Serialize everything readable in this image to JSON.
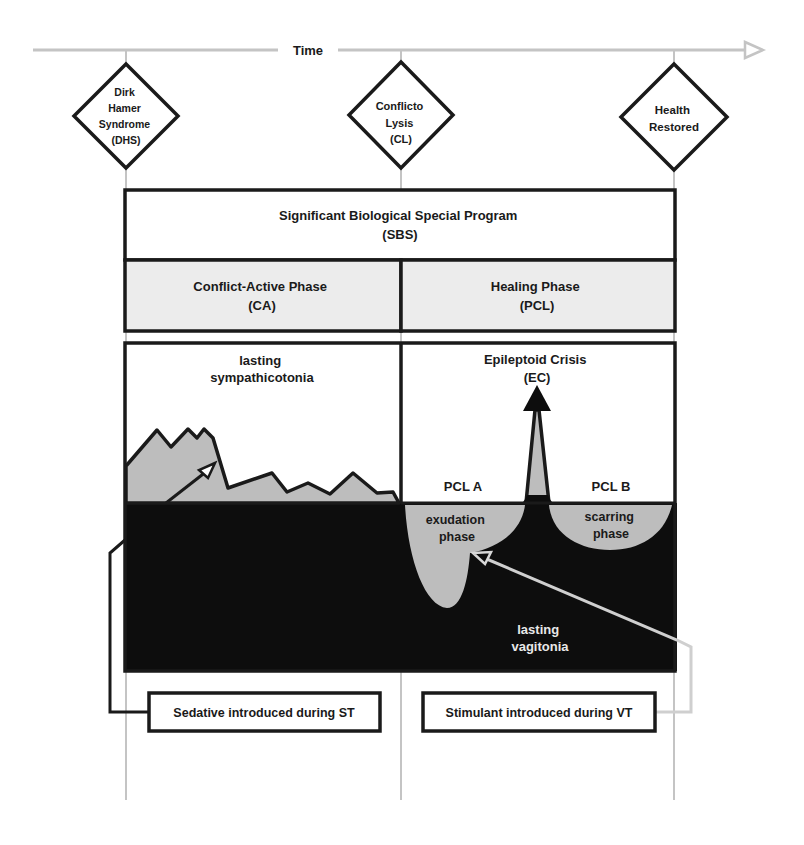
{
  "timeline": {
    "label": "Time",
    "milestones": [
      {
        "id": "dhs",
        "lines": [
          "Dirk",
          "Hamer",
          "Syndrome",
          "(DHS)"
        ]
      },
      {
        "id": "cl",
        "lines": [
          "Conflicto",
          "Lysis",
          "(CL)"
        ]
      },
      {
        "id": "health",
        "lines": [
          "Health",
          "Restored"
        ]
      }
    ]
  },
  "sbs": {
    "title": "Significant Biological Special Program",
    "abbr": "(SBS)"
  },
  "phases": {
    "active": {
      "title": "Conflict-Active Phase",
      "abbr": "(CA)"
    },
    "healing": {
      "title": "Healing Phase",
      "abbr": "(PCL)"
    }
  },
  "graph": {
    "sympathicotonia": [
      "lasting",
      "sympathicotonia"
    ],
    "epileptoid": {
      "title": "Epileptoid Crisis",
      "abbr": "(EC)"
    },
    "pcl_a": "PCL A",
    "pcl_b": "PCL B",
    "exudation": [
      "exudation",
      "phase"
    ],
    "scarring": [
      "scarring",
      "phase"
    ],
    "vagitonia": [
      "lasting",
      "vagitonia"
    ]
  },
  "notes": {
    "sedative": "Sedative introduced during ST",
    "stimulant": "Stimulant introduced during VT"
  },
  "colors": {
    "line": "#1a1a1a",
    "gray_fill": "#bdbdbd",
    "light_fill": "#ececec",
    "timeline_gray": "#c4c4c4",
    "dark_fill": "#0d0d0d"
  }
}
